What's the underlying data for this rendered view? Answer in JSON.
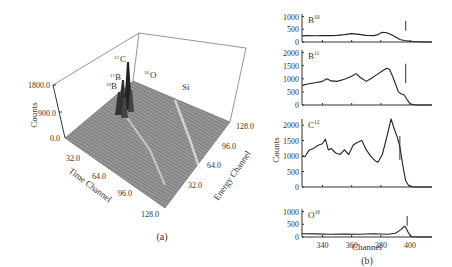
{
  "figure": {
    "panel_a_label": "(a)",
    "panel_b_label": "(b)"
  },
  "chart_data": [
    {
      "type": "surface3d",
      "panel": "(a)",
      "zlabel": "Counts",
      "xlabel": "Time Channel",
      "ylabel": "Energy Channel",
      "z_ticks": [
        "0.0",
        "900.0",
        "1800.0"
      ],
      "x_ticks": [
        "32.0",
        "64.0",
        "96.0",
        "128.0"
      ],
      "y_ticks": [
        "32.0",
        "64.0",
        "96.0",
        "128.0"
      ],
      "zlim": [
        0,
        1800
      ],
      "xlim": [
        0,
        128
      ],
      "ylim": [
        0,
        128
      ],
      "annotations": [
        {
          "mass": "12",
          "element": "C"
        },
        {
          "mass": "11",
          "element": "B"
        },
        {
          "mass": "10",
          "element": "B"
        },
        {
          "mass": "16",
          "element": "O"
        },
        {
          "mass": "",
          "element": "Si"
        }
      ]
    },
    {
      "type": "line",
      "panel": "(b)",
      "xlabel": "Channel",
      "ylabel": "Counts",
      "x_ticks": [
        340,
        360,
        380,
        400
      ],
      "xlim": [
        326,
        415
      ],
      "subplots": [
        {
          "name": "B",
          "superscript": "10",
          "ylim": [
            0,
            1100
          ],
          "y_ticks": [
            0,
            500,
            1000
          ],
          "marker_x": 397,
          "x": [
            326,
            330,
            335,
            340,
            345,
            350,
            355,
            360,
            365,
            370,
            375,
            378,
            381,
            384,
            387,
            390,
            393,
            396,
            399,
            402,
            405,
            410,
            415
          ],
          "y": [
            240,
            250,
            245,
            255,
            250,
            260,
            290,
            330,
            300,
            260,
            250,
            290,
            380,
            360,
            300,
            200,
            100,
            60,
            40,
            20,
            10,
            0,
            0
          ]
        },
        {
          "name": "B",
          "superscript": "11",
          "ylim": [
            0,
            2100
          ],
          "y_ticks": [
            0,
            500,
            1000,
            1500,
            2000
          ],
          "marker_x": 397,
          "x": [
            326,
            330,
            335,
            340,
            343,
            346,
            350,
            355,
            360,
            363,
            366,
            370,
            373,
            377,
            381,
            384,
            386,
            388,
            390,
            392,
            394,
            396,
            398,
            400,
            402,
            405,
            410,
            415
          ],
          "y": [
            750,
            800,
            850,
            900,
            1000,
            920,
            900,
            980,
            1100,
            1200,
            1050,
            900,
            1000,
            1150,
            1300,
            1400,
            1350,
            1100,
            800,
            500,
            420,
            380,
            200,
            50,
            20,
            0,
            0,
            0
          ],
          "_comment": "values estimated from image"
        },
        {
          "name": "C",
          "superscript": "12",
          "ylim": [
            0,
            2200
          ],
          "y_ticks": [
            0,
            500,
            1000,
            1500,
            2000
          ],
          "marker_x": 393,
          "x": [
            326,
            328,
            331,
            334,
            337,
            340,
            342,
            344,
            346,
            349,
            352,
            355,
            358,
            361,
            364,
            367,
            370,
            373,
            376,
            378,
            381,
            384,
            387,
            389,
            391,
            393,
            395,
            397,
            399,
            402,
            405,
            410,
            415
          ],
          "y": [
            1000,
            980,
            1200,
            1250,
            1350,
            1400,
            1550,
            1200,
            1250,
            1100,
            1050,
            1200,
            1050,
            1350,
            1450,
            1500,
            1200,
            1000,
            850,
            800,
            1050,
            1600,
            2200,
            1900,
            1650,
            1300,
            700,
            200,
            50,
            0,
            0,
            0,
            0
          ]
        },
        {
          "name": "O",
          "superscript": "16",
          "ylim": [
            0,
            1100
          ],
          "y_ticks": [
            0,
            500,
            1000
          ],
          "marker_x": 398,
          "x": [
            326,
            335,
            345,
            355,
            365,
            375,
            385,
            390,
            394,
            396,
            397,
            399,
            401,
            405,
            410,
            415
          ],
          "y": [
            130,
            120,
            110,
            115,
            105,
            130,
            110,
            150,
            300,
            420,
            380,
            150,
            10,
            0,
            0,
            0
          ]
        }
      ]
    }
  ]
}
